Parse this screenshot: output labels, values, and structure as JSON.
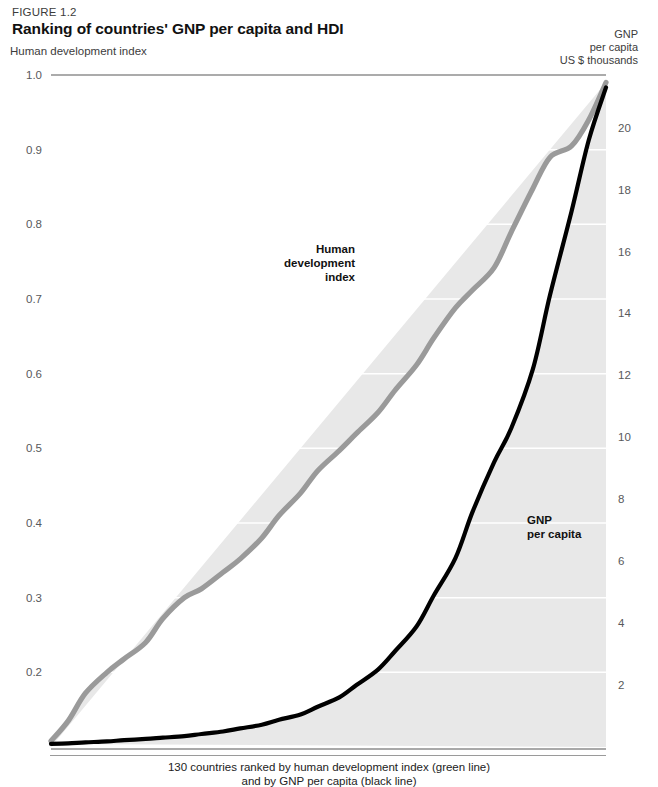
{
  "figure": {
    "number": "FIGURE 1.2",
    "title": "Ranking of countries' GNP per capita and HDI"
  },
  "axes": {
    "left_title": "Human development index",
    "right_title_line1": "GNP",
    "right_title_line2": "per capita",
    "right_title_line3": "US $ thousands",
    "left_ticks": [
      "1.0",
      "0.9",
      "0.8",
      "0.7",
      "0.6",
      "0.5",
      "0.4",
      "0.3",
      "0.2"
    ],
    "right_ticks": [
      "20",
      "18",
      "16",
      "14",
      "12",
      "10",
      "8",
      "6",
      "4",
      "2"
    ]
  },
  "labels": {
    "hdi_line1": "Human",
    "hdi_line2": "development",
    "hdi_line3": "index",
    "gnp_line1": "GNP",
    "gnp_line2": "per capita"
  },
  "caption": {
    "line1": "130 countries ranked by human development index (green line)",
    "line2": "and by GNP per capita (black line)"
  },
  "colors": {
    "hdi_line": "#9a9a9a",
    "gnp_line": "#000000",
    "band_fill": "#e8e8e8",
    "gridline": "#ffffff",
    "tick_text": "#58595b",
    "title_text": "#111111"
  },
  "chart_data": {
    "type": "line",
    "title": "Ranking of countries' GNP per capita and HDI",
    "xlabel": "130 countries ranked by human development index (green line) and by GNP per capita (black line)",
    "ylabel": "Human development index",
    "y2label": "GNP per capita, US $ thousands",
    "grid": true,
    "legend": "inline-annotations",
    "xlim": [
      1,
      130
    ],
    "ylim": [
      0.1,
      1.0
    ],
    "y2lim": [
      0,
      21.7
    ],
    "yticks": [
      0.2,
      0.3,
      0.4,
      0.5,
      0.6,
      0.7,
      0.8,
      0.9,
      1.0
    ],
    "y2ticks": [
      2,
      4,
      6,
      8,
      10,
      12,
      14,
      16,
      18,
      20
    ],
    "series": [
      {
        "name": "Human development index",
        "axis": "left",
        "color": "#9a9a9a",
        "x": [
          1,
          5,
          9,
          14,
          18,
          23,
          27,
          32,
          36,
          41,
          45,
          50,
          54,
          59,
          63,
          68,
          72,
          77,
          81,
          86,
          90,
          95,
          99,
          104,
          108,
          113,
          117,
          122,
          126,
          130
        ],
        "values": [
          0.108,
          0.135,
          0.172,
          0.2,
          0.218,
          0.24,
          0.272,
          0.3,
          0.312,
          0.334,
          0.352,
          0.38,
          0.41,
          0.44,
          0.47,
          0.497,
          0.52,
          0.548,
          0.578,
          0.612,
          0.648,
          0.688,
          0.712,
          0.742,
          0.79,
          0.848,
          0.89,
          0.905,
          0.94,
          0.99
        ]
      },
      {
        "name": "GNP per capita",
        "axis": "right",
        "color": "#000000",
        "x": [
          1,
          5,
          9,
          14,
          18,
          23,
          27,
          32,
          36,
          41,
          45,
          50,
          54,
          59,
          63,
          68,
          72,
          77,
          81,
          86,
          90,
          95,
          99,
          104,
          108,
          113,
          117,
          122,
          126,
          130
        ],
        "values": [
          0.1,
          0.12,
          0.15,
          0.18,
          0.22,
          0.26,
          0.3,
          0.35,
          0.42,
          0.5,
          0.6,
          0.72,
          0.88,
          1.05,
          1.3,
          1.6,
          2.0,
          2.5,
          3.1,
          3.9,
          4.9,
          6.1,
          7.6,
          9.2,
          10.3,
          12.2,
          14.6,
          17.3,
          19.6,
          21.3
        ]
      }
    ]
  }
}
